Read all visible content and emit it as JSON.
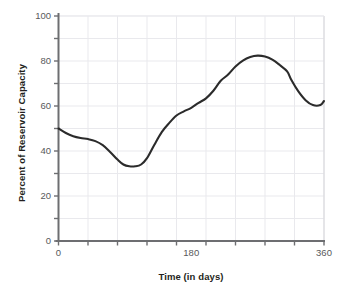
{
  "chart_data": {
    "type": "line",
    "title": "",
    "subtitle": "",
    "xlabel": "Time (in days)",
    "ylabel": "Percent of Reservoir Capacity",
    "xlim": [
      0,
      360
    ],
    "ylim": [
      0,
      100
    ],
    "grid": true,
    "grid_x_step": 40,
    "grid_y_step": 10,
    "legend": "none",
    "x_tick_labels": [
      {
        "value": 0,
        "label": "0"
      },
      {
        "value": 180,
        "label": "180"
      },
      {
        "value": 360,
        "label": "360"
      }
    ],
    "x_tick_marks": [
      0,
      40,
      80,
      120,
      160,
      200,
      240,
      280,
      320,
      360
    ],
    "y_tick_labels": [
      {
        "value": 100,
        "label": "100"
      },
      {
        "value": 80,
        "label": "80"
      },
      {
        "value": 60,
        "label": "60"
      },
      {
        "value": 40,
        "label": "40"
      },
      {
        "value": 20,
        "label": "20"
      },
      {
        "value": 0,
        "label": "0"
      }
    ],
    "y_tick_marks": [
      0,
      10,
      20,
      30,
      40,
      50,
      60,
      70,
      80,
      90,
      100
    ],
    "line_color": "#2b2b2b",
    "grid_color": "#e9e9ed",
    "axis_color": "#6d6e71",
    "series": [
      {
        "name": "Percent of Reservoir Capacity",
        "x": [
          0,
          10,
          20,
          30,
          40,
          50,
          60,
          70,
          80,
          88,
          96,
          104,
          112,
          120,
          130,
          140,
          150,
          160,
          170,
          180,
          190,
          200,
          210,
          220,
          230,
          240,
          250,
          260,
          270,
          280,
          290,
          300,
          310,
          316,
          325,
          335,
          345,
          355,
          360
        ],
        "y": [
          50.0,
          48.0,
          46.6,
          45.8,
          45.3,
          44.4,
          42.6,
          39.6,
          36.2,
          34.0,
          33.2,
          33.2,
          34.0,
          36.8,
          42.8,
          48.4,
          52.4,
          55.8,
          57.6,
          59.2,
          61.4,
          63.4,
          66.8,
          71.2,
          74.0,
          77.6,
          80.2,
          81.8,
          82.4,
          82.0,
          80.6,
          78.2,
          75.4,
          71.4,
          66.6,
          62.6,
          60.4,
          60.4,
          62.2
        ]
      }
    ],
    "annotations": []
  }
}
